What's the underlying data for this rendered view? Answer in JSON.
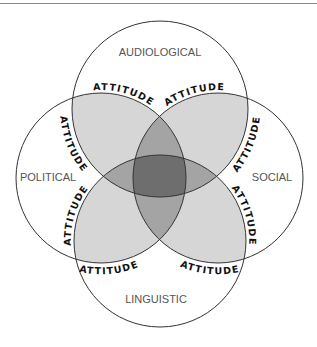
{
  "diagram": {
    "title": "",
    "circles": [
      {
        "id": "top",
        "label": "AUDIOLOGICAL",
        "cx": 160,
        "cy": 109,
        "r": 88
      },
      {
        "id": "left",
        "label": "POLITICAL",
        "cx": 101,
        "cy": 178,
        "r": 85
      },
      {
        "id": "right",
        "label": "SOCIAL",
        "cx": 218,
        "cy": 178,
        "r": 85
      },
      {
        "id": "bottom",
        "label": "LINGUISTIC",
        "cx": 160,
        "cy": 241,
        "r": 86
      }
    ],
    "attitude_label": "ATTITUDE",
    "attitude_labels": [
      {
        "position": "top-left",
        "text": "ATTITUDE"
      },
      {
        "position": "top-right",
        "text": "ATTITUDE"
      },
      {
        "position": "left-upper",
        "text": "ATTITUDE"
      },
      {
        "position": "left-lower",
        "text": "ATTITUDE"
      },
      {
        "position": "right-upper",
        "text": "ATTITUDE"
      },
      {
        "position": "right-lower",
        "text": "ATTITUDE"
      },
      {
        "position": "bottom-left",
        "text": "ATTITUDE"
      },
      {
        "position": "bottom-right",
        "text": "ATTITUDE"
      }
    ],
    "colors": {
      "stroke": "#333333",
      "overlap_two": "#d6d6d6",
      "overlap_three": "#a4a4a4",
      "overlap_four": "#6e6e6e",
      "label": "#555555",
      "rule": "#8a8a8a"
    }
  }
}
